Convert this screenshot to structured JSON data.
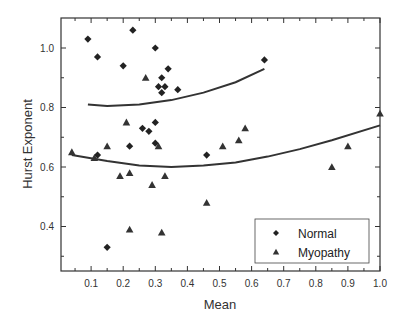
{
  "chart_data": {
    "type": "scatter",
    "title": "",
    "xlabel": "Mean",
    "ylabel": "Hurst Exponent",
    "xlim": [
      0.0,
      1.0
    ],
    "ylim": [
      0.25,
      1.1
    ],
    "grid": false,
    "legend_position": "lower right (inside)",
    "x_ticks": [
      "0.1",
      "0.2",
      "0.3",
      "0.4",
      "0.5",
      "0.6",
      "0.7",
      "0.8",
      "0.9",
      "1.0"
    ],
    "y_ticks": [
      "0.4",
      "0.6",
      "0.8",
      "1.0"
    ],
    "series": [
      {
        "name": "Normal",
        "marker": "diamond",
        "color": "#222222",
        "points": [
          [
            0.09,
            1.03
          ],
          [
            0.12,
            0.97
          ],
          [
            0.23,
            1.06
          ],
          [
            0.2,
            0.94
          ],
          [
            0.3,
            1.0
          ],
          [
            0.34,
            0.93
          ],
          [
            0.32,
            0.9
          ],
          [
            0.33,
            0.87
          ],
          [
            0.31,
            0.87
          ],
          [
            0.32,
            0.85
          ],
          [
            0.37,
            0.86
          ],
          [
            0.26,
            0.73
          ],
          [
            0.28,
            0.72
          ],
          [
            0.3,
            0.75
          ],
          [
            0.3,
            0.68
          ],
          [
            0.22,
            0.67
          ],
          [
            0.12,
            0.64
          ],
          [
            0.15,
            0.33
          ],
          [
            0.46,
            0.64
          ],
          [
            0.64,
            0.96
          ]
        ],
        "fit_curve": {
          "type": "quadratic",
          "x_range": [
            0.09,
            0.64
          ],
          "points": [
            [
              0.09,
              0.81
            ],
            [
              0.15,
              0.805
            ],
            [
              0.25,
              0.81
            ],
            [
              0.35,
              0.825
            ],
            [
              0.45,
              0.85
            ],
            [
              0.55,
              0.885
            ],
            [
              0.64,
              0.93
            ]
          ]
        }
      },
      {
        "name": "Myopathy",
        "marker": "triangle",
        "color": "#333333",
        "points": [
          [
            0.04,
            0.65
          ],
          [
            0.11,
            0.63
          ],
          [
            0.15,
            0.67
          ],
          [
            0.21,
            0.75
          ],
          [
            0.27,
            0.9
          ],
          [
            0.31,
            0.67
          ],
          [
            0.19,
            0.57
          ],
          [
            0.22,
            0.58
          ],
          [
            0.29,
            0.54
          ],
          [
            0.33,
            0.57
          ],
          [
            0.22,
            0.39
          ],
          [
            0.32,
            0.38
          ],
          [
            0.46,
            0.48
          ],
          [
            0.51,
            0.67
          ],
          [
            0.56,
            0.69
          ],
          [
            0.58,
            0.73
          ],
          [
            0.85,
            0.6
          ],
          [
            0.9,
            0.67
          ],
          [
            1.0,
            0.78
          ]
        ],
        "fit_curve": {
          "type": "quadratic",
          "x_range": [
            0.04,
            1.0
          ],
          "points": [
            [
              0.04,
              0.64
            ],
            [
              0.15,
              0.62
            ],
            [
              0.25,
              0.605
            ],
            [
              0.35,
              0.6
            ],
            [
              0.45,
              0.605
            ],
            [
              0.55,
              0.615
            ],
            [
              0.65,
              0.635
            ],
            [
              0.75,
              0.66
            ],
            [
              0.85,
              0.69
            ],
            [
              1.0,
              0.74
            ]
          ]
        }
      }
    ]
  },
  "axes": {
    "xlabel": "Mean",
    "ylabel": "Hurst Exponent"
  },
  "legend": {
    "items": [
      {
        "label": "Normal",
        "marker": "diamond"
      },
      {
        "label": "Myopathy",
        "marker": "triangle"
      }
    ]
  }
}
